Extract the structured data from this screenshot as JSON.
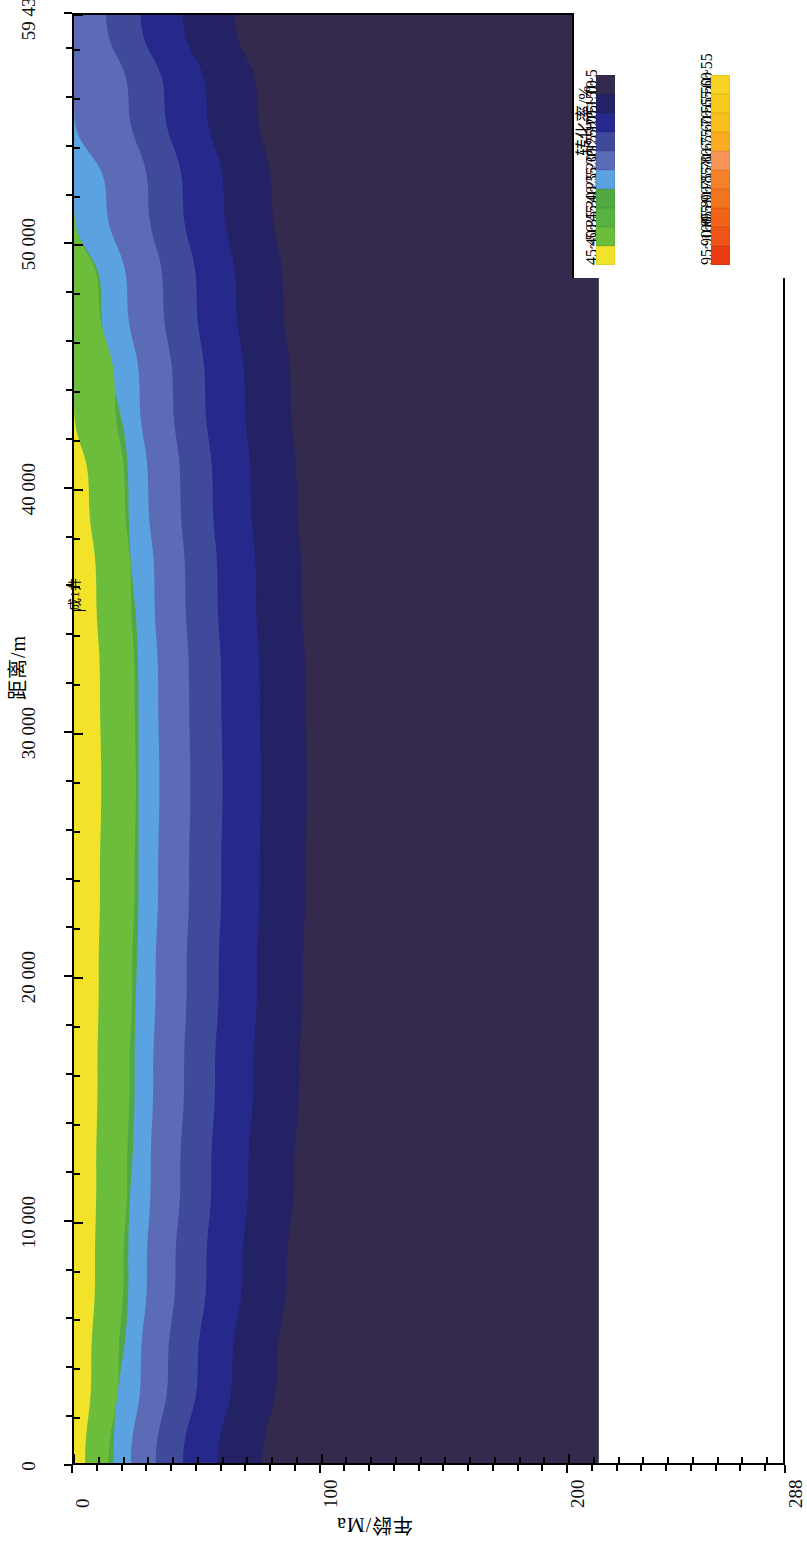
{
  "figure": {
    "orientation": "rotated-90",
    "background": "#ffffff"
  },
  "axes": {
    "y": {
      "title": "距离/m",
      "ticks": [
        {
          "value": 0,
          "label": "0"
        },
        {
          "value": 10000,
          "label": "10 000"
        },
        {
          "value": 20000,
          "label": "20 000"
        },
        {
          "value": 30000,
          "label": "30 000"
        },
        {
          "value": 40000,
          "label": "40 000"
        },
        {
          "value": 50000,
          "label": "50 000"
        },
        {
          "value": 59430,
          "label": "59 430"
        }
      ],
      "min": 0,
      "max": 59430
    },
    "x": {
      "title": "年龄/Ma",
      "ticks": [
        {
          "value": 0,
          "label": "0"
        },
        {
          "value": 100,
          "label": "100"
        },
        {
          "value": 200,
          "label": "200"
        },
        {
          "value": 288,
          "label": "288"
        }
      ],
      "min": 0,
      "max": 288
    }
  },
  "annotations": [
    {
      "name": "well-label",
      "text": "成1井",
      "x_ma": 0,
      "y_m": 35500
    }
  ],
  "legend": {
    "title": "转化率/%",
    "entries": [
      {
        "label": "0~5",
        "color": "#332a4e"
      },
      {
        "label": "5~10",
        "color": "#232264"
      },
      {
        "label": "10~15",
        "color": "#26288c"
      },
      {
        "label": "15~20",
        "color": "#3f4a9b"
      },
      {
        "label": "20~25",
        "color": "#5b6bb5"
      },
      {
        "label": "25~30",
        "color": "#5ba3e0"
      },
      {
        "label": "30~35",
        "color": "#52a844"
      },
      {
        "label": "35~40",
        "color": "#58b243"
      },
      {
        "label": "40~45",
        "color": "#6cbd3c"
      },
      {
        "label": "45~50",
        "color": "#f2e32a"
      },
      {
        "label": "50~55",
        "color": "#f7d423"
      },
      {
        "label": "55~60",
        "color": "#f8cb1f"
      },
      {
        "label": "60~65",
        "color": "#f9bf1c"
      },
      {
        "label": "65~70",
        "color": "#f9ad23"
      },
      {
        "label": "70~75",
        "color": "#f59455"
      },
      {
        "label": "75~80",
        "color": "#f5802a"
      },
      {
        "label": "80~85",
        "color": "#f4751f"
      },
      {
        "label": "85~90",
        "color": "#f1631a"
      },
      {
        "label": "90~95",
        "color": "#ee5419"
      },
      {
        "label": "95~100",
        "color": "#ea3a12"
      }
    ]
  },
  "chart_data": {
    "type": "contour",
    "title": "",
    "xlabel": "年龄/Ma",
    "ylabel": "距离/m",
    "xlim": [
      0,
      288
    ],
    "ylim": [
      0,
      59430
    ],
    "grid": false,
    "legend_position": "top-right",
    "value_unit": "%",
    "value_name": "转化率",
    "note": "Filled contour map of hydrocarbon transformation ratio (转化率) versus geologic age (Ma) and lateral distance (m). Data only populated for ages 0-212 Ma; region right of ~212 Ma is blank. Bands nest with highest values (45~50%, yellow) hugging the age=0 edge around mid-distance and decreasing monotonically with increasing age.",
    "bands": [
      {
        "label": "45~50",
        "color": "#f2e32a",
        "comment": "outermost yellow band; present only for y between 0 and ~44000 m",
        "boundary_age_by_distance": [
          {
            "y_m": 0,
            "age_ma": 4.5
          },
          {
            "y_m": 4000,
            "age_ma": 7.0
          },
          {
            "y_m": 8000,
            "age_ma": 8.5
          },
          {
            "y_m": 12000,
            "age_ma": 9.0
          },
          {
            "y_m": 16000,
            "age_ma": 9.5
          },
          {
            "y_m": 20000,
            "age_ma": 10.0
          },
          {
            "y_m": 24000,
            "age_ma": 10.5
          },
          {
            "y_m": 28000,
            "age_ma": 11.0
          },
          {
            "y_m": 32000,
            "age_ma": 10.5
          },
          {
            "y_m": 36000,
            "age_ma": 9.0
          },
          {
            "y_m": 40000,
            "age_ma": 6.0
          },
          {
            "y_m": 43500,
            "age_ma": 0.0
          }
        ]
      },
      {
        "label": "40~45",
        "color": "#6cbd3c",
        "comment": "green band; pinches out near y = 51500 m",
        "boundary_age_by_distance": [
          {
            "y_m": 0,
            "age_ma": 14.0
          },
          {
            "y_m": 4000,
            "age_ma": 18.0
          },
          {
            "y_m": 8000,
            "age_ma": 20.0
          },
          {
            "y_m": 12000,
            "age_ma": 21.5
          },
          {
            "y_m": 16000,
            "age_ma": 22.5
          },
          {
            "y_m": 20000,
            "age_ma": 23.5
          },
          {
            "y_m": 24000,
            "age_ma": 24.5
          },
          {
            "y_m": 28000,
            "age_ma": 25.0
          },
          {
            "y_m": 32000,
            "age_ma": 24.5
          },
          {
            "y_m": 36000,
            "age_ma": 23.0
          },
          {
            "y_m": 40000,
            "age_ma": 20.5
          },
          {
            "y_m": 44000,
            "age_ma": 16.5
          },
          {
            "y_m": 48000,
            "age_ma": 10.0
          },
          {
            "y_m": 51500,
            "age_ma": 0.0
          }
        ]
      },
      {
        "label": "30~35",
        "color": "#52a844",
        "comment": "inner green shade, merged visually with 40~45 band",
        "boundary_age_by_distance": [
          {
            "y_m": 0,
            "age_ma": 16.0
          },
          {
            "y_m": 8000,
            "age_ma": 22.0
          },
          {
            "y_m": 16000,
            "age_ma": 24.5
          },
          {
            "y_m": 24000,
            "age_ma": 26.0
          },
          {
            "y_m": 32000,
            "age_ma": 26.0
          },
          {
            "y_m": 40000,
            "age_ma": 22.0
          },
          {
            "y_m": 48000,
            "age_ma": 11.0
          },
          {
            "y_m": 51500,
            "age_ma": 0.0
          }
        ]
      },
      {
        "label": "25~30",
        "color": "#5ba3e0",
        "comment": "light blue band; persists to about y = 55500 m",
        "boundary_age_by_distance": [
          {
            "y_m": 0,
            "age_ma": 23.0
          },
          {
            "y_m": 4000,
            "age_ma": 27.0
          },
          {
            "y_m": 8000,
            "age_ma": 29.5
          },
          {
            "y_m": 12000,
            "age_ma": 31.0
          },
          {
            "y_m": 16000,
            "age_ma": 32.0
          },
          {
            "y_m": 20000,
            "age_ma": 33.0
          },
          {
            "y_m": 24000,
            "age_ma": 34.0
          },
          {
            "y_m": 28000,
            "age_ma": 34.5
          },
          {
            "y_m": 32000,
            "age_ma": 34.0
          },
          {
            "y_m": 36000,
            "age_ma": 32.5
          },
          {
            "y_m": 40000,
            "age_ma": 30.0
          },
          {
            "y_m": 44000,
            "age_ma": 26.5
          },
          {
            "y_m": 48000,
            "age_ma": 21.5
          },
          {
            "y_m": 52000,
            "age_ma": 13.0
          },
          {
            "y_m": 55500,
            "age_ma": 0.0
          }
        ]
      },
      {
        "label": "20~25",
        "color": "#5b6bb5",
        "comment": "medium slate blue band; reaches the top of the section",
        "boundary_age_by_distance": [
          {
            "y_m": 0,
            "age_ma": 33.0
          },
          {
            "y_m": 4000,
            "age_ma": 38.0
          },
          {
            "y_m": 8000,
            "age_ma": 41.0
          },
          {
            "y_m": 12000,
            "age_ma": 43.0
          },
          {
            "y_m": 16000,
            "age_ma": 44.5
          },
          {
            "y_m": 20000,
            "age_ma": 45.5
          },
          {
            "y_m": 24000,
            "age_ma": 46.5
          },
          {
            "y_m": 28000,
            "age_ma": 47.0
          },
          {
            "y_m": 32000,
            "age_ma": 46.5
          },
          {
            "y_m": 36000,
            "age_ma": 45.0
          },
          {
            "y_m": 40000,
            "age_ma": 43.0
          },
          {
            "y_m": 44000,
            "age_ma": 40.0
          },
          {
            "y_m": 48000,
            "age_ma": 36.0
          },
          {
            "y_m": 52000,
            "age_ma": 30.0
          },
          {
            "y_m": 56000,
            "age_ma": 22.0
          },
          {
            "y_m": 59430,
            "age_ma": 13.0
          }
        ]
      },
      {
        "label": "15~20",
        "color": "#3f4a9b",
        "comment": "deeper slate blue band",
        "boundary_age_by_distance": [
          {
            "y_m": 0,
            "age_ma": 44.0
          },
          {
            "y_m": 4000,
            "age_ma": 50.0
          },
          {
            "y_m": 8000,
            "age_ma": 53.5
          },
          {
            "y_m": 12000,
            "age_ma": 55.5
          },
          {
            "y_m": 16000,
            "age_ma": 57.0
          },
          {
            "y_m": 20000,
            "age_ma": 58.5
          },
          {
            "y_m": 24000,
            "age_ma": 59.5
          },
          {
            "y_m": 28000,
            "age_ma": 60.0
          },
          {
            "y_m": 32000,
            "age_ma": 59.5
          },
          {
            "y_m": 36000,
            "age_ma": 58.0
          },
          {
            "y_m": 40000,
            "age_ma": 56.0
          },
          {
            "y_m": 44000,
            "age_ma": 53.0
          },
          {
            "y_m": 48000,
            "age_ma": 49.5
          },
          {
            "y_m": 52000,
            "age_ma": 44.0
          },
          {
            "y_m": 56000,
            "age_ma": 36.5
          },
          {
            "y_m": 59430,
            "age_ma": 27.0
          }
        ]
      },
      {
        "label": "10~15",
        "color": "#26288c",
        "comment": "strong blue band",
        "boundary_age_by_distance": [
          {
            "y_m": 0,
            "age_ma": 58.0
          },
          {
            "y_m": 4000,
            "age_ma": 64.0
          },
          {
            "y_m": 8000,
            "age_ma": 68.0
          },
          {
            "y_m": 12000,
            "age_ma": 70.5
          },
          {
            "y_m": 16000,
            "age_ma": 72.5
          },
          {
            "y_m": 20000,
            "age_ma": 74.0
          },
          {
            "y_m": 24000,
            "age_ma": 75.0
          },
          {
            "y_m": 28000,
            "age_ma": 75.5
          },
          {
            "y_m": 32000,
            "age_ma": 75.0
          },
          {
            "y_m": 36000,
            "age_ma": 73.5
          },
          {
            "y_m": 40000,
            "age_ma": 71.5
          },
          {
            "y_m": 44000,
            "age_ma": 69.0
          },
          {
            "y_m": 48000,
            "age_ma": 65.5
          },
          {
            "y_m": 52000,
            "age_ma": 60.5
          },
          {
            "y_m": 56000,
            "age_ma": 53.5
          },
          {
            "y_m": 59430,
            "age_ma": 44.0
          }
        ]
      },
      {
        "label": "5~10",
        "color": "#232264",
        "comment": "dark navy band, widest near the base of the section",
        "boundary_age_by_distance": [
          {
            "y_m": 0,
            "age_ma": 76.0
          },
          {
            "y_m": 4000,
            "age_ma": 82.0
          },
          {
            "y_m": 8000,
            "age_ma": 86.0
          },
          {
            "y_m": 12000,
            "age_ma": 89.0
          },
          {
            "y_m": 16000,
            "age_ma": 91.0
          },
          {
            "y_m": 20000,
            "age_ma": 92.5
          },
          {
            "y_m": 24000,
            "age_ma": 93.5
          },
          {
            "y_m": 28000,
            "age_ma": 94.0
          },
          {
            "y_m": 32000,
            "age_ma": 93.5
          },
          {
            "y_m": 36000,
            "age_ma": 92.0
          },
          {
            "y_m": 40000,
            "age_ma": 90.0
          },
          {
            "y_m": 44000,
            "age_ma": 87.5
          },
          {
            "y_m": 48000,
            "age_ma": 84.5
          },
          {
            "y_m": 52000,
            "age_ma": 80.0
          },
          {
            "y_m": 56000,
            "age_ma": 74.0
          },
          {
            "y_m": 59430,
            "age_ma": 65.0
          }
        ]
      },
      {
        "label": "0~5",
        "color": "#332a4e",
        "comment": "dark purple background band filling the remainder out to ~212 Ma",
        "boundary_age_by_distance": [
          {
            "y_m": 0,
            "age_ma": 212
          },
          {
            "y_m": 59430,
            "age_ma": 212
          }
        ]
      }
    ],
    "data_extent_age_ma": 212
  }
}
